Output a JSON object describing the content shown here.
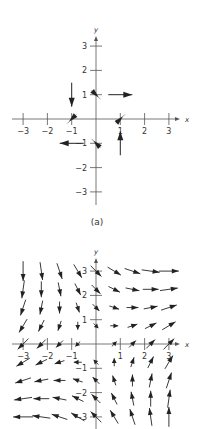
{
  "header": {
    "text": "14.2   Vector Fields"
  },
  "figure_a": {
    "caption": "(a)",
    "x_axis_label": "x",
    "y_axis_label": "y",
    "x_ticks": [
      -3,
      -2,
      -1,
      1,
      2,
      3
    ],
    "y_ticks": [
      -3,
      -2,
      -1,
      1,
      2,
      3
    ],
    "x_tick_labels": [
      "−3",
      "−2",
      "−1",
      "1",
      "2",
      "3"
    ],
    "y_tick_labels": [
      "3",
      "2",
      "1",
      "−1",
      "−2",
      "−3"
    ],
    "vectors": [
      {
        "x": 0,
        "y": 1,
        "dx": 0.5,
        "dy": -0.5,
        "style": "diag"
      },
      {
        "x": 1,
        "y": 1,
        "dx": 1,
        "dy": 0,
        "style": "long"
      },
      {
        "x": -1,
        "y": 1,
        "dx": 0,
        "dy": -1,
        "style": "long"
      },
      {
        "x": -1,
        "y": 0,
        "dx": -0.5,
        "dy": -0.5,
        "style": "diag"
      },
      {
        "x": 1,
        "y": 0,
        "dx": 0.5,
        "dy": 0.5,
        "style": "diag"
      },
      {
        "x": -1,
        "y": -1,
        "dx": -1,
        "dy": 0,
        "style": "long"
      },
      {
        "x": 0,
        "y": -1,
        "dx": -0.5,
        "dy": 0.5,
        "style": "diag"
      },
      {
        "x": 1,
        "y": -1,
        "dx": 0,
        "dy": 1,
        "style": "long"
      }
    ]
  },
  "figure_b": {
    "x_axis_label": "x",
    "y_axis_label": "y",
    "x_tick_labels": [
      "−3",
      "−2",
      "−1",
      "1",
      "2",
      "3"
    ],
    "y_tick_labels": [
      "3",
      "2",
      "1",
      "−1",
      "−2",
      "−3"
    ],
    "field": "F(x, y) = ⟨x + y, x − y⟩",
    "grid_values": [
      -3,
      -2.25,
      -1.5,
      -0.75,
      0,
      0.75,
      1.5,
      2.25,
      3
    ]
  },
  "chart_data": [
    {
      "type": "vector_field",
      "title": "(a)",
      "xlabel": "x",
      "ylabel": "y",
      "xlim": [
        -3,
        3
      ],
      "ylim": [
        -3,
        3
      ],
      "points": [
        {
          "x": 0,
          "y": 1,
          "u": 1,
          "v": -1
        },
        {
          "x": 1,
          "y": 1,
          "u": 1,
          "v": 0
        },
        {
          "x": -1,
          "y": 1,
          "u": 0,
          "v": -1
        },
        {
          "x": -1,
          "y": 0,
          "u": -1,
          "v": -1
        },
        {
          "x": 1,
          "y": 0,
          "u": 1,
          "v": 1
        },
        {
          "x": -1,
          "y": -1,
          "u": -1,
          "v": 0
        },
        {
          "x": 0,
          "y": -1,
          "u": -1,
          "v": 1
        },
        {
          "x": 1,
          "y": -1,
          "u": 0,
          "v": 1
        }
      ]
    },
    {
      "type": "vector_field",
      "title": "(b)",
      "xlabel": "x",
      "ylabel": "y",
      "xlim": [
        -3,
        3
      ],
      "ylim": [
        -3,
        3
      ],
      "field": "<x + y, x - y>",
      "grid": [
        -3,
        -2.25,
        -1.5,
        -0.75,
        0,
        0.75,
        1.5,
        2.25,
        3
      ]
    }
  ]
}
